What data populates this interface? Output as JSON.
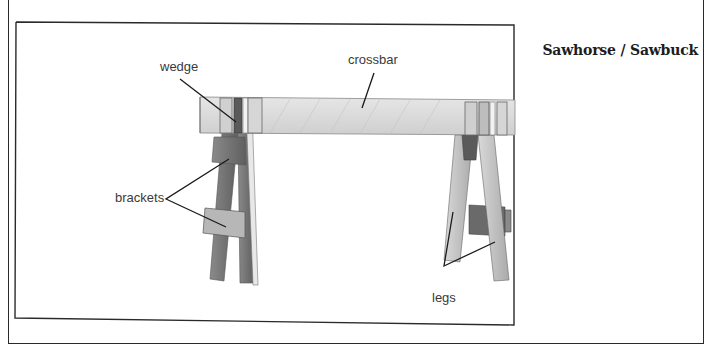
{
  "figure": {
    "title": "Sawhorse / Sawbuck",
    "labels": {
      "wedge": "wedge",
      "crossbar": "crossbar",
      "brackets": "brackets",
      "legs": "legs"
    },
    "colors": {
      "frame": "#2a2a2a",
      "wood_light": "#dcdcdc",
      "wood_mid": "#a9a9a9",
      "wood_dark": "#6e6e6e",
      "label_text": "#3a3a3a",
      "leader_line": "#1a1a1a"
    }
  }
}
